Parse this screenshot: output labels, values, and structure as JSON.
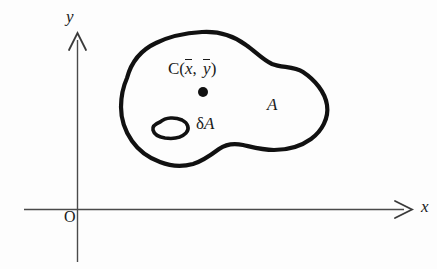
{
  "figure": {
    "kind": "centroid-diagram",
    "caption_absent": true,
    "background_color": "#fdfdfd",
    "ink_color": "#1a1a1a",
    "axis_color": "#4a4a4a"
  },
  "axes": {
    "x_label": "x",
    "y_label": "y",
    "origin_label": "O",
    "x_axis_name": "horizontal-axis",
    "y_axis_name": "vertical-axis",
    "arrowhead_style": "open-v"
  },
  "labels": {
    "centroid_prefix": "C(",
    "centroid_xbar": "x",
    "centroid_comma": ", ",
    "centroid_ybar": "y",
    "centroid_suffix": ")",
    "centroid_full": "C(x̄, ȳ)",
    "area_label": "A",
    "element_delta": "δ",
    "element_area": "A",
    "element_full": "δA"
  },
  "shapes": {
    "region_name": "area-region-A",
    "element_name": "area-element-delta-A",
    "centroid_marker_name": "centroid-point-marker",
    "centroid_marker_radius": 5
  }
}
